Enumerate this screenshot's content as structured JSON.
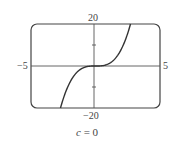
{
  "chart_data": {
    "type": "line",
    "title": "",
    "caption": "c = 0",
    "function": "y = x^3 + c x, c = 0",
    "xlabel": "",
    "ylabel": "",
    "xlim": [
      -5,
      5
    ],
    "ylim": [
      -20,
      20
    ],
    "x_tick_labels": [
      "-5",
      "5"
    ],
    "y_tick_labels": [
      "20",
      "-20"
    ],
    "grid": false,
    "legend": null,
    "series": [
      {
        "name": "y = x^3",
        "x": [
          -2.714,
          -2.5,
          -2,
          -1.5,
          -1,
          -0.5,
          0,
          0.5,
          1,
          1.5,
          2,
          2.5,
          2.714
        ],
        "y": [
          -20,
          -15.63,
          -8,
          -3.38,
          -1,
          -0.13,
          0,
          0.13,
          1,
          3.38,
          8,
          15.63,
          20
        ]
      }
    ]
  },
  "labels": {
    "x_min": "−5",
    "x_max": "5",
    "y_max": "20",
    "y_min": "−20",
    "caption_var": "c",
    "caption_eq": " = 0"
  }
}
